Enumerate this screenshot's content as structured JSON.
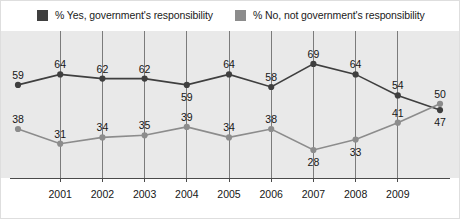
{
  "legend": {
    "entries": [
      {
        "label": "% Yes, government's responsibility",
        "color": "#3f3f3f",
        "swatch_name": "legend-swatch-yes"
      },
      {
        "label": "% No, not government's responsibility",
        "color": "#8c8c8c",
        "swatch_name": "legend-swatch-no"
      }
    ]
  },
  "chart_data": {
    "type": "line",
    "title": "",
    "xlabel": "",
    "ylabel": "",
    "x": [
      2000,
      2001,
      2002,
      2003,
      2004,
      2005,
      2006,
      2007,
      2008,
      2009,
      2010
    ],
    "categories": [
      "2000",
      "2001",
      "2002",
      "2003",
      "2004",
      "2005",
      "2006",
      "2007",
      "2008",
      "2009",
      "2010"
    ],
    "tick_labels": [
      "",
      "2001",
      "2002",
      "2003",
      "2004",
      "2005",
      "2006",
      "2007",
      "2008",
      "2009",
      ""
    ],
    "series": [
      {
        "name": "% Yes, government's responsibility",
        "color": "#3f3f3f",
        "values": [
          59,
          64,
          62,
          62,
          59,
          64,
          58,
          69,
          64,
          54,
          47
        ],
        "label_positions": [
          "above",
          "above",
          "above",
          "above",
          "below",
          "above",
          "above",
          "above",
          "above",
          "above",
          "below"
        ]
      },
      {
        "name": "% No, not government's responsibility",
        "color": "#8c8c8c",
        "values": [
          38,
          31,
          34,
          35,
          39,
          34,
          38,
          28,
          33,
          41,
          50
        ],
        "label_positions": [
          "above",
          "above",
          "above",
          "above",
          "above",
          "above",
          "above",
          "below",
          "below",
          "above",
          "above"
        ]
      }
    ],
    "ylim": [
      18,
      78
    ],
    "xlim": [
      2000,
      2010
    ],
    "grid": "vertical",
    "gridline_years": [
      "2001",
      "2002",
      "2003",
      "2004",
      "2005",
      "2006",
      "2007",
      "2008",
      "2009"
    ],
    "legend_position": "top",
    "colors": {
      "plot_background": "#e9e9e9",
      "page_background": "#ffffff",
      "gridline": "#7b7b7b",
      "axis": "#4a4a4a",
      "text": "#161616"
    }
  }
}
